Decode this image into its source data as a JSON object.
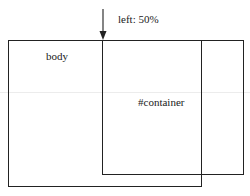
{
  "diagram": {
    "annotation": "left: 50%",
    "outer_box_label": "body",
    "inner_box_label": "#container",
    "arrow": {
      "direction": "down",
      "points_to": "left edge of #container"
    },
    "colors": {
      "stroke": "#222222",
      "background": "#ffffff"
    }
  }
}
